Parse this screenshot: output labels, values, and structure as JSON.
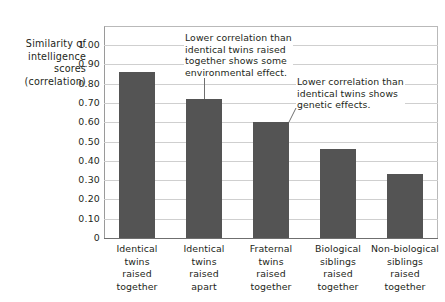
{
  "chart_data": {
    "type": "bar",
    "title": "",
    "subtitle": "",
    "xlabel": "",
    "ylabel": "Similarity of intelligence scores (correlation)",
    "ylabel_lines": [
      "Similarity of",
      "intelligence",
      "scores",
      "(correlation)"
    ],
    "ylim": [
      0,
      1.05
    ],
    "ytick_values": [
      1.0,
      0.9,
      0.8,
      0.7,
      0.6,
      0.5,
      0.4,
      0.3,
      0.2,
      0.1,
      0
    ],
    "ytick_labels": [
      "1.00",
      "0.90",
      "0.80",
      "0.70",
      "0.60",
      "0.50",
      "0.40",
      "0.30",
      "0.20",
      "0.10",
      "0"
    ],
    "grid": true,
    "grid_axis": "y",
    "legend": false,
    "legend_position": "none",
    "bar_color": "#545454",
    "gridline_color": "#cfcfcf",
    "axis_color": "#6f6f6f",
    "text_color": "#231f20",
    "background": "#ffffff",
    "categories": [
      "Identical twins raised together",
      "Identical twins raised apart",
      "Fraternal twins raised together",
      "Biological siblings raised together",
      "Non-biological siblings raised together"
    ],
    "category_label_lines": [
      [
        "Identical",
        "twins",
        "raised",
        "together"
      ],
      [
        "Identical",
        "twins",
        "raised",
        "apart"
      ],
      [
        "Fraternal",
        "twins",
        "raised",
        "together"
      ],
      [
        "Biological",
        "siblings",
        "raised",
        "together"
      ],
      [
        "Non-biological",
        "siblings",
        "raised",
        "together"
      ]
    ],
    "values": [
      0.86,
      0.72,
      0.6,
      0.46,
      0.33
    ],
    "annotations": [
      {
        "id": "environmental-effect",
        "text": "Lower correlation than identical twins raised together shows some environmental effect.",
        "lines": [
          "Lower correlation than",
          "identical twins raised",
          "together shows some",
          "environmental effect."
        ],
        "points_to_category": "Identical twins raised apart"
      },
      {
        "id": "genetic-effects",
        "text": "Lower correlation than identical twins shows genetic effects.",
        "lines": [
          "Lower correlation than",
          "identical twins shows",
          "genetic effects."
        ],
        "points_to_category": "Fraternal twins raised together"
      }
    ]
  }
}
